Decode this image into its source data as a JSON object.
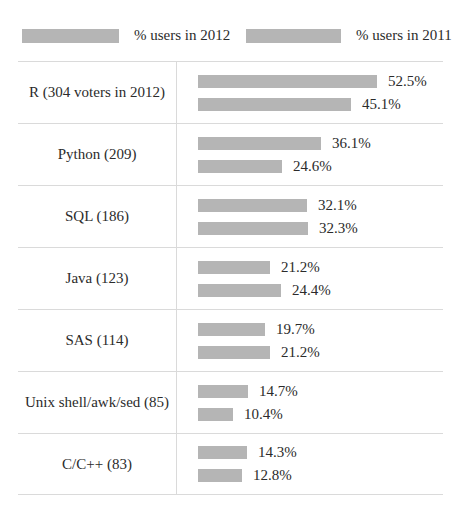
{
  "legend": {
    "swatch_color": "#b5b5b5",
    "label_2012": "% users in 2012",
    "label_2011": "% users in 2011"
  },
  "chart_data": {
    "type": "bar",
    "orientation": "horizontal",
    "title": "",
    "xlabel": "",
    "ylabel": "",
    "bar_color": "#b5b5b5",
    "separator_color": "#dadada",
    "legend_position": "top",
    "value_suffix": "%",
    "categories": [
      "R (304 voters in 2012)",
      "Python (209)",
      "SQL (186)",
      "Java (123)",
      "SAS (114)",
      "Unix shell/awk/sed (85)",
      "C/C++ (83)"
    ],
    "series": [
      {
        "name": "% users in 2012",
        "values": [
          52.5,
          36.1,
          32.1,
          21.2,
          19.7,
          14.7,
          14.3
        ]
      },
      {
        "name": "% users in 2011",
        "values": [
          45.1,
          24.6,
          32.3,
          24.4,
          21.2,
          10.4,
          12.8
        ]
      }
    ],
    "rows": [
      {
        "label": "R (304 voters in 2012)",
        "pct_2012": 52.5,
        "pct_2011": 45.1
      },
      {
        "label": "Python (209)",
        "pct_2012": 36.1,
        "pct_2011": 24.6
      },
      {
        "label": "SQL (186)",
        "pct_2012": 32.1,
        "pct_2011": 32.3
      },
      {
        "label": "Java (123)",
        "pct_2012": 21.2,
        "pct_2011": 24.4
      },
      {
        "label": "SAS (114)",
        "pct_2012": 19.7,
        "pct_2011": 21.2
      },
      {
        "label": "Unix shell/awk/sed (85)",
        "pct_2012": 14.7,
        "pct_2011": 10.4
      },
      {
        "label": "C/C++ (83)",
        "pct_2012": 14.3,
        "pct_2011": 12.8
      }
    ]
  }
}
